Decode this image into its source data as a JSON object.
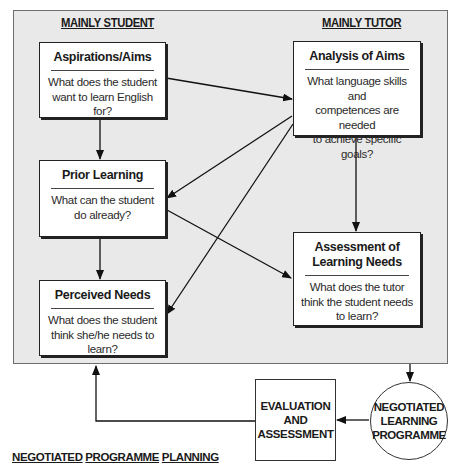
{
  "figure": {
    "caption_words": [
      "NEGOTIATED",
      "PROGRAMME",
      "PLANNING"
    ]
  },
  "columns": {
    "left_heading": "MAINLY STUDENT",
    "right_heading": "MAINLY TUTOR"
  },
  "boxes": {
    "aspirations": {
      "title": "Aspirations/Aims",
      "question_lines": [
        "What does the student",
        "want to learn English for?"
      ]
    },
    "analysis": {
      "title": "Analysis of Aims",
      "question_lines": [
        "What language skills and",
        "competences are needed",
        "to achieve specific",
        "goals?"
      ]
    },
    "prior": {
      "title": "Prior Learning",
      "question_lines": [
        "What can the student",
        "do already?"
      ]
    },
    "assessment": {
      "title_lines": [
        "Assessment of",
        "Learning Needs"
      ],
      "question_lines": [
        "What does the tutor",
        "think the student needs",
        "to learn?"
      ]
    },
    "perceived": {
      "title": "Perceived Needs",
      "question_lines": [
        "What does the student",
        "think she/he needs to",
        "learn?"
      ]
    }
  },
  "cycle": {
    "evaluation_lines": [
      "EVALUATION",
      "AND",
      "ASSESSMENT"
    ],
    "programme_lines": [
      "NEGOTIATED",
      "LEARNING",
      "PROGRAMME"
    ]
  },
  "connections": [
    {
      "from": "Aspirations/Aims",
      "to": "Analysis of Aims"
    },
    {
      "from": "Aspirations/Aims",
      "to": "Prior Learning"
    },
    {
      "from": "Analysis of Aims",
      "to": "Prior Learning"
    },
    {
      "from": "Analysis of Aims",
      "to": "Perceived Needs"
    },
    {
      "from": "Analysis of Aims",
      "to": "Assessment of Learning Needs"
    },
    {
      "from": "Prior Learning",
      "to": "Perceived Needs"
    },
    {
      "from": "Prior Learning",
      "to": "Assessment of Learning Needs"
    },
    {
      "from": "Planning panel",
      "to": "Negotiated Learning Programme"
    },
    {
      "from": "Negotiated Learning Programme",
      "to": "Evaluation and Assessment"
    },
    {
      "from": "Evaluation and Assessment",
      "to": "Planning panel"
    }
  ]
}
